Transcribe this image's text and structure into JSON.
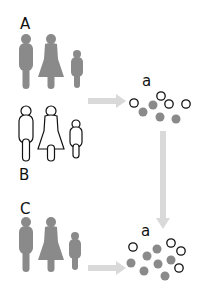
{
  "labels": {
    "group_a": "A",
    "group_b": "B",
    "group_c": "C",
    "cluster_top": "a",
    "cluster_bottom": "a"
  },
  "colors": {
    "filled_figure": "#8a8a8a",
    "outline_figure": "#111111",
    "arrow": "#d9d9d9",
    "filled_dot": "#8a8a8a",
    "open_dot_stroke": "#111111"
  },
  "groups": [
    {
      "id": "A",
      "style": "filled",
      "members": [
        "man",
        "woman",
        "child"
      ]
    },
    {
      "id": "B",
      "style": "outline",
      "members": [
        "man",
        "woman",
        "child"
      ]
    },
    {
      "id": "C",
      "style": "filled",
      "members": [
        "man",
        "woman",
        "child"
      ]
    }
  ],
  "clusters": [
    {
      "label": "a",
      "filled_dots": 5,
      "open_dots": 5
    },
    {
      "label": "a",
      "filled_dots": 8,
      "open_dots": 4
    }
  ]
}
